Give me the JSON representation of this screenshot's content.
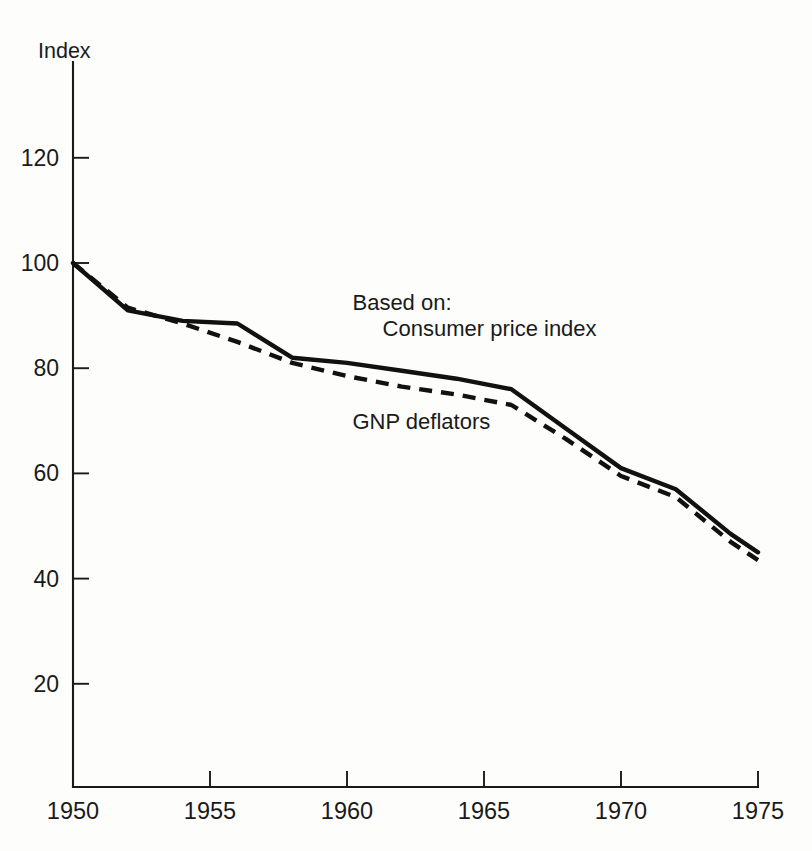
{
  "chart_data": {
    "type": "line",
    "title": "",
    "subtitle": "",
    "xlabel": "",
    "ylabel": "Index",
    "xlim": [
      1950,
      1975
    ],
    "ylim": [
      0,
      130
    ],
    "grid": false,
    "legend_position": "inline-annotation",
    "legend_heading": "Based on:",
    "x_ticks": [
      1950,
      1955,
      1960,
      1965,
      1970,
      1975
    ],
    "x_tick_labels": [
      "1950",
      "1955",
      "1960",
      "1965",
      "1970",
      "1975"
    ],
    "y_ticks": [
      20,
      40,
      60,
      80,
      100,
      120
    ],
    "y_tick_labels": [
      "20",
      "40",
      "60",
      "80",
      "100",
      "120"
    ],
    "annotations": [
      {
        "name": "legend-heading",
        "text": "Based on:",
        "x": 1960.2,
        "y": 91.0
      },
      {
        "name": "legend-solid-label",
        "text": "Consumer price index",
        "x": 1961.3,
        "y": 86.2
      },
      {
        "name": "legend-dashed-label",
        "text": "GNP deflators",
        "x": 1960.2,
        "y": 68.5
      }
    ],
    "series": [
      {
        "name": "Consumer price index",
        "style": "solid",
        "x": [
          1950,
          1952,
          1954,
          1956,
          1958,
          1960,
          1962,
          1964,
          1966,
          1968,
          1970,
          1972,
          1974,
          1975
        ],
        "values": [
          100,
          91,
          89,
          88.5,
          82,
          81,
          79.5,
          78,
          76,
          68.5,
          61,
          57,
          48.5,
          45
        ]
      },
      {
        "name": "GNP deflators",
        "style": "dashed",
        "x": [
          1950,
          1952,
          1954,
          1956,
          1958,
          1960,
          1962,
          1964,
          1966,
          1968,
          1970,
          1972,
          1974,
          1975
        ],
        "values": [
          100,
          91.5,
          88.5,
          85,
          81,
          78.5,
          76.5,
          75,
          73,
          66.5,
          59.5,
          55.5,
          47,
          43.5
        ]
      }
    ]
  },
  "colors": {
    "ink": "#111111",
    "axis": "#1a1a1a",
    "paper": "#fdfdfb"
  }
}
